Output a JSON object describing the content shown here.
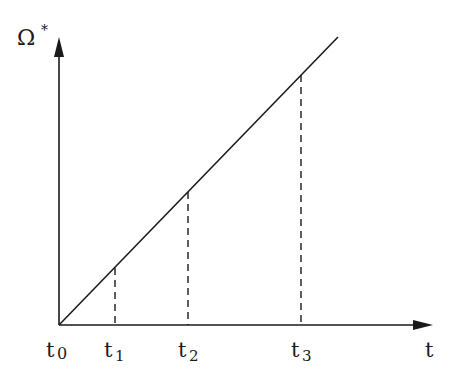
{
  "diagram": {
    "y_axis_label": "Ω",
    "y_axis_superscript": "*",
    "x_axis_label": "t",
    "ticks": [
      {
        "label": "t",
        "sub": "0",
        "x": 59
      },
      {
        "label": "t",
        "sub": "1",
        "x": 115
      },
      {
        "label": "t",
        "sub": "2",
        "x": 188
      },
      {
        "label": "t",
        "sub": "3",
        "x": 301
      }
    ],
    "line": {
      "x1": 59,
      "y1": 325,
      "x2": 338,
      "y2": 37
    },
    "colors": {
      "stroke": "#1a1a1a",
      "background": "#ffffff"
    }
  }
}
